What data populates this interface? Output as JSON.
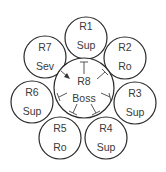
{
  "diagram": {
    "type": "regulatory-network",
    "center": {
      "id": "R8",
      "role": "Boss"
    },
    "nodes": [
      {
        "id": "R1",
        "role": "Sup"
      },
      {
        "id": "R2",
        "role": "Ro"
      },
      {
        "id": "R3",
        "role": "Sup"
      },
      {
        "id": "R4",
        "role": "Sup"
      },
      {
        "id": "R5",
        "role": "Ro"
      },
      {
        "id": "R6",
        "role": "Sup"
      },
      {
        "id": "R7",
        "role": "Sev"
      }
    ],
    "edges": [
      {
        "from": "R8",
        "to": "R1",
        "type": "inhibit"
      },
      {
        "from": "R8",
        "to": "R2",
        "type": "inhibit"
      },
      {
        "from": "R8",
        "to": "R3",
        "type": "inhibit"
      },
      {
        "from": "R8",
        "to": "R4",
        "type": "inhibit"
      },
      {
        "from": "R8",
        "to": "R5",
        "type": "inhibit"
      },
      {
        "from": "R8",
        "to": "R6",
        "type": "inhibit"
      },
      {
        "from": "R7",
        "to": "R8",
        "type": "activate"
      }
    ]
  }
}
